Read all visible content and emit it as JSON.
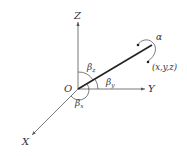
{
  "diagram": {
    "axes": {
      "z_label": "Z",
      "y_label": "Y",
      "x_label": "X",
      "origin_label": "O"
    },
    "angles": {
      "beta_z": "β",
      "beta_z_sub": "z",
      "beta_y": "β",
      "beta_y_sub": "y",
      "beta_x": "β",
      "beta_x_sub": "x"
    },
    "rotation_label": "α",
    "point_label": "(x,y,z)"
  }
}
